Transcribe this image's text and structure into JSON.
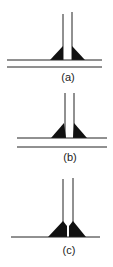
{
  "figure": {
    "panels": [
      {
        "id": "a",
        "label": "(a)",
        "description": "Vertical plate on two horizontal plates with fillet welds"
      },
      {
        "id": "b",
        "label": "(b)",
        "description": "Vertical plate on two horizontal plates (wider gap) with fillet welds"
      },
      {
        "id": "c",
        "label": "(c)",
        "description": "Vertical plate on single horizontal plate with fillet welds"
      }
    ],
    "colors": {
      "line": "#222222",
      "weld": "#111111",
      "background": "#ffffff"
    }
  }
}
